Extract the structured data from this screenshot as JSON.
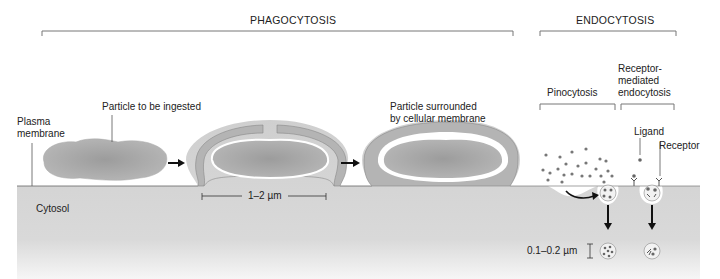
{
  "headers": {
    "phagocytosis": "PHAGOCYTOSIS",
    "endocytosis": "ENDOCYTOSIS"
  },
  "subheaders": {
    "pinocytosis": "Pinocytosis",
    "receptor_mediated_line1": "Receptor-",
    "receptor_mediated_line2": "mediated",
    "receptor_mediated_line3": "endocytosis"
  },
  "labels": {
    "plasma_membrane_line1": "Plasma",
    "plasma_membrane_line2": "membrane",
    "particle_to_be_ingested": "Particle to be ingested",
    "particle_surrounded_line1": "Particle surrounded",
    "particle_surrounded_line2": "by cellular membrane",
    "cytosol": "Cytosol",
    "ligand": "Ligand",
    "receptor": "Receptor"
  },
  "measurements": {
    "phagosome_size": "1–2 µm",
    "vesicle_size": "0.1–0.2 µm"
  },
  "colors": {
    "cytosol": "#d2d2d2",
    "particle": "#9a9a9a",
    "membrane": "#b4b4b4",
    "line": "#444444"
  }
}
